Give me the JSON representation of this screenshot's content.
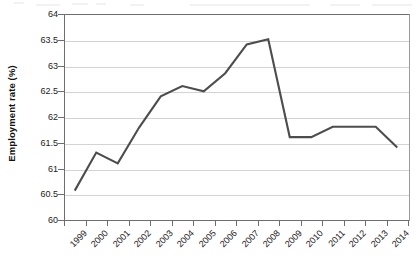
{
  "chart_data": {
    "type": "line",
    "title": "",
    "xlabel": "",
    "ylabel": "Employment rate (%)",
    "categories": [
      "1999",
      "2000",
      "2001",
      "2002",
      "2003",
      "2004",
      "2005",
      "2006",
      "2007",
      "2008",
      "2009",
      "2010",
      "2011",
      "2012",
      "2013",
      "2014"
    ],
    "values": [
      60.57,
      61.31,
      61.1,
      61.8,
      62.4,
      62.6,
      62.5,
      62.85,
      63.41,
      63.51,
      61.61,
      61.61,
      61.81,
      61.81,
      61.81,
      61.41
    ],
    "series": [
      {
        "name": "Employment rate",
        "values": [
          60.57,
          61.31,
          61.1,
          61.8,
          62.4,
          62.6,
          62.5,
          62.85,
          63.41,
          63.51,
          61.61,
          61.61,
          61.81,
          61.81,
          61.81,
          61.41
        ]
      }
    ],
    "ylim": [
      60,
      64
    ],
    "ytick_step": 0.5,
    "ytick_labels": [
      "64",
      "63.5",
      "63",
      "62.5",
      "62",
      "61.5",
      "61",
      "60.5",
      "60"
    ],
    "ytick_values": [
      64,
      63.5,
      63,
      62.5,
      62,
      61.5,
      61,
      60.5,
      60
    ],
    "xlim": [
      "1999",
      "2014"
    ],
    "grid": "horizontal",
    "legend": "none",
    "line_color": "#4d4d4d",
    "grid_color": "#d3d3d3",
    "axis_color": "#6e6e6e",
    "background_color": "#ffffff"
  }
}
